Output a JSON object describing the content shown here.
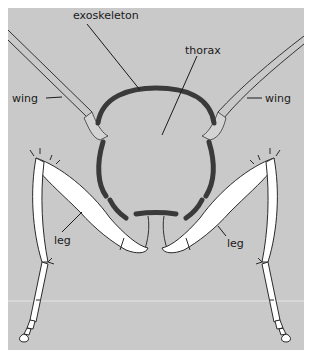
{
  "diagram": {
    "labels": {
      "exoskeleton": "exoskeleton",
      "thorax": "thorax",
      "wing_left": "wing",
      "wing_right": "wing",
      "leg_left": "leg",
      "leg_right": "leg"
    },
    "colors": {
      "background": "#c9c9c9",
      "exoskeleton": "#3a3a3a",
      "leg_fill": "#ffffff",
      "outline": "#2a2a2a"
    }
  }
}
